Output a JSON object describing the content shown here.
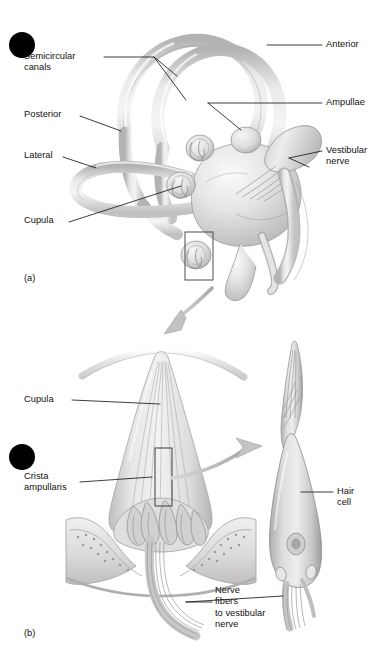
{
  "figure": {
    "title_visible": false,
    "background_color": "#ffffff",
    "line_color": "#1a1a1a",
    "tissue_fill_light": "#eceaea",
    "tissue_fill_mid": "#d9d7d7",
    "tissue_fill_dark": "#b9b7b7",
    "arrow_color": "#bdbbbb",
    "bullet_color": "#000000"
  },
  "panel_a": {
    "id": "(a)",
    "bullet": {
      "name": "black-dot-marker",
      "cx": 22,
      "cy": 45,
      "r": 13
    },
    "labels_left": [
      {
        "key": "semicircular_canals",
        "text": "Semicircular\ncanals",
        "x": 24,
        "y": 52
      },
      {
        "key": "posterior",
        "text": "Posterior",
        "x": 24,
        "y": 114
      },
      {
        "key": "lateral",
        "text": "Lateral",
        "x": 24,
        "y": 155
      },
      {
        "key": "cupula",
        "text": "Cupula",
        "x": 24,
        "y": 220
      }
    ],
    "labels_right": [
      {
        "key": "anterior",
        "text": "Anterior",
        "x": 325,
        "y": 44
      },
      {
        "key": "ampullae",
        "text": "Ampullae",
        "x": 325,
        "y": 100
      },
      {
        "key": "vestibular_nerve",
        "text": "Vestibular\nnerve",
        "x": 325,
        "y": 148
      }
    ],
    "inset_box": {
      "x": 185,
      "y": 232,
      "w": 28,
      "h": 48
    }
  },
  "transition_arrow": {
    "name": "zoom-in-arrow",
    "from": [
      210,
      288
    ],
    "to": [
      168,
      332
    ],
    "color": "#bdbbbb"
  },
  "panel_b": {
    "id": "(b)",
    "bullet": {
      "name": "black-dot-marker",
      "cx": 22,
      "cy": 457,
      "r": 13
    },
    "labels_left": [
      {
        "key": "cupula",
        "text": "Cupula",
        "x": 24,
        "y": 398
      },
      {
        "key": "crista_ampullaris",
        "text": "Crista\nampullaris",
        "x": 24,
        "y": 476
      }
    ],
    "labels_center": [
      {
        "key": "nerve_fibers",
        "text": "Nerve\nfibers\nto vestibular\nnerve",
        "x": 215,
        "y": 580
      }
    ],
    "labels_right": [
      {
        "key": "hair_cell",
        "text": "Hair\ncell",
        "x": 336,
        "y": 487
      }
    ],
    "inset_box": {
      "x": 155,
      "y": 448,
      "w": 17,
      "h": 58
    },
    "callout_arrow": {
      "name": "hair-cell-callout-arrow",
      "from": [
        170,
        478
      ],
      "to": [
        255,
        450
      ]
    }
  },
  "leader_lines": {
    "semicircular_canals": [
      [
        104,
        57
      ],
      [
        154,
        57
      ],
      [
        186,
        100
      ]
    ],
    "semicircular_canals_2": [
      [
        154,
        57
      ],
      [
        176,
        74
      ]
    ],
    "posterior": [
      [
        79,
        116
      ],
      [
        120,
        131
      ]
    ],
    "lateral": [
      [
        62,
        157
      ],
      [
        95,
        168
      ]
    ],
    "cupula_a": [
      [
        68,
        222
      ],
      [
        180,
        185
      ]
    ],
    "anterior": [
      [
        268,
        45
      ],
      [
        322,
        45
      ]
    ],
    "ampullae": [
      [
        207,
        103
      ],
      [
        322,
        103
      ]
    ],
    "ampullae_2": [
      [
        207,
        103
      ],
      [
        240,
        128
      ]
    ],
    "vestibular_nerve": [
      [
        288,
        158
      ],
      [
        322,
        152
      ]
    ],
    "vestibular_nerve_2": [
      [
        288,
        158
      ],
      [
        308,
        166
      ]
    ],
    "cupula_b": [
      [
        72,
        400
      ],
      [
        160,
        404
      ]
    ],
    "crista_ampullaris": [
      [
        80,
        482
      ],
      [
        152,
        476
      ]
    ],
    "nerve_fibers": [
      [
        186,
        602
      ],
      [
        212,
        602
      ]
    ],
    "nerve_fibers_2": [
      [
        186,
        602
      ],
      [
        282,
        596
      ]
    ],
    "hair_cell": [
      [
        300,
        492
      ],
      [
        333,
        492
      ]
    ]
  }
}
